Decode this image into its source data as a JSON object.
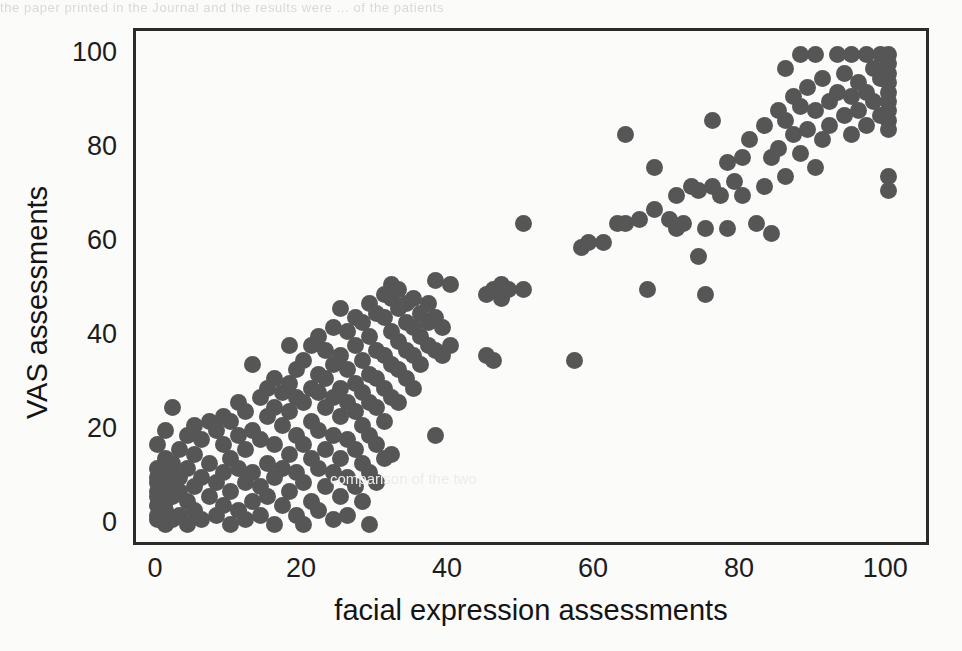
{
  "page": {
    "bleed_through_top": "the paper printed in the Journal  and the  results  were  ...  of the  patients",
    "bleed_through_middle": "comparison of the two"
  },
  "chart_data": {
    "type": "scatter",
    "title": "",
    "subtitle": "",
    "xlabel": "facial expression assessments",
    "ylabel": "VAS assessments",
    "xlim": [
      -3,
      106
    ],
    "ylim": [
      -5,
      105
    ],
    "xticks": [
      0,
      20,
      40,
      60,
      80,
      100
    ],
    "yticks": [
      0,
      20,
      40,
      60,
      80,
      100
    ],
    "xtick_labels": [
      "0",
      "20",
      "40",
      "60",
      "80",
      "100"
    ],
    "ytick_labels": [
      "0",
      "20",
      "40",
      "60",
      "80",
      "100"
    ],
    "grid": false,
    "legend": null,
    "marker": {
      "shape": "circle",
      "color": "#565656",
      "size_px": 17
    },
    "frame": {
      "color": "#2b2b2b",
      "width_px": 3,
      "all_sides": true
    },
    "series": [
      {
        "name": "patient assessment pairs",
        "color": "#565656",
        "points": [
          [
            0,
            1
          ],
          [
            0,
            2
          ],
          [
            0,
            4
          ],
          [
            0,
            6
          ],
          [
            0,
            7
          ],
          [
            0,
            9
          ],
          [
            0,
            10
          ],
          [
            0,
            12
          ],
          [
            0,
            17
          ],
          [
            1,
            0
          ],
          [
            1,
            3
          ],
          [
            1,
            5
          ],
          [
            1,
            8
          ],
          [
            1,
            11
          ],
          [
            1,
            14
          ],
          [
            1,
            20
          ],
          [
            2,
            1
          ],
          [
            2,
            6
          ],
          [
            2,
            9
          ],
          [
            2,
            13
          ],
          [
            2,
            25
          ],
          [
            3,
            2
          ],
          [
            3,
            7
          ],
          [
            3,
            10
          ],
          [
            3,
            16
          ],
          [
            4,
            0
          ],
          [
            4,
            5
          ],
          [
            4,
            12
          ],
          [
            4,
            19
          ],
          [
            5,
            3
          ],
          [
            5,
            8
          ],
          [
            5,
            15
          ],
          [
            5,
            21
          ],
          [
            6,
            1
          ],
          [
            6,
            10
          ],
          [
            6,
            18
          ],
          [
            7,
            6
          ],
          [
            7,
            13
          ],
          [
            7,
            22
          ],
          [
            8,
            2
          ],
          [
            8,
            9
          ],
          [
            8,
            20
          ],
          [
            9,
            4
          ],
          [
            9,
            11
          ],
          [
            9,
            17
          ],
          [
            9,
            23
          ],
          [
            10,
            0
          ],
          [
            10,
            7
          ],
          [
            10,
            14
          ],
          [
            10,
            22
          ],
          [
            11,
            3
          ],
          [
            11,
            12
          ],
          [
            11,
            19
          ],
          [
            11,
            26
          ],
          [
            12,
            1
          ],
          [
            12,
            9
          ],
          [
            12,
            16
          ],
          [
            12,
            24
          ],
          [
            13,
            5
          ],
          [
            13,
            11
          ],
          [
            13,
            20
          ],
          [
            13,
            34
          ],
          [
            14,
            2
          ],
          [
            14,
            8
          ],
          [
            14,
            18
          ],
          [
            14,
            27
          ],
          [
            15,
            6
          ],
          [
            15,
            13
          ],
          [
            15,
            23
          ],
          [
            15,
            29
          ],
          [
            16,
            0
          ],
          [
            16,
            10
          ],
          [
            16,
            17
          ],
          [
            16,
            25
          ],
          [
            16,
            31
          ],
          [
            17,
            4
          ],
          [
            17,
            12
          ],
          [
            17,
            21
          ],
          [
            17,
            28
          ],
          [
            18,
            7
          ],
          [
            18,
            15
          ],
          [
            18,
            24
          ],
          [
            18,
            30
          ],
          [
            18,
            38
          ],
          [
            19,
            2
          ],
          [
            19,
            11
          ],
          [
            19,
            19
          ],
          [
            19,
            27
          ],
          [
            19,
            33
          ],
          [
            20,
            0
          ],
          [
            20,
            9
          ],
          [
            20,
            17
          ],
          [
            20,
            26
          ],
          [
            20,
            35
          ],
          [
            21,
            5
          ],
          [
            21,
            14
          ],
          [
            21,
            22
          ],
          [
            21,
            29
          ],
          [
            21,
            38
          ],
          [
            22,
            3
          ],
          [
            22,
            12
          ],
          [
            22,
            20
          ],
          [
            22,
            28
          ],
          [
            22,
            32
          ],
          [
            22,
            40
          ],
          [
            23,
            8
          ],
          [
            23,
            16
          ],
          [
            23,
            25
          ],
          [
            23,
            31
          ],
          [
            23,
            37
          ],
          [
            24,
            1
          ],
          [
            24,
            11
          ],
          [
            24,
            19
          ],
          [
            24,
            27
          ],
          [
            24,
            34
          ],
          [
            24,
            42
          ],
          [
            25,
            6
          ],
          [
            25,
            14
          ],
          [
            25,
            23
          ],
          [
            25,
            29
          ],
          [
            25,
            36
          ],
          [
            25,
            46
          ],
          [
            26,
            2
          ],
          [
            26,
            10
          ],
          [
            26,
            18
          ],
          [
            26,
            26
          ],
          [
            26,
            33
          ],
          [
            26,
            41
          ],
          [
            27,
            8
          ],
          [
            27,
            16
          ],
          [
            27,
            24
          ],
          [
            27,
            30
          ],
          [
            27,
            38
          ],
          [
            27,
            44
          ],
          [
            28,
            5
          ],
          [
            28,
            13
          ],
          [
            28,
            21
          ],
          [
            28,
            28
          ],
          [
            28,
            35
          ],
          [
            28,
            43
          ],
          [
            29,
            0
          ],
          [
            29,
            11
          ],
          [
            29,
            19
          ],
          [
            29,
            26
          ],
          [
            29,
            32
          ],
          [
            29,
            40
          ],
          [
            29,
            47
          ],
          [
            30,
            9
          ],
          [
            30,
            17
          ],
          [
            30,
            25
          ],
          [
            30,
            31
          ],
          [
            30,
            37
          ],
          [
            30,
            45
          ],
          [
            31,
            14
          ],
          [
            31,
            22
          ],
          [
            31,
            29
          ],
          [
            31,
            36
          ],
          [
            31,
            44
          ],
          [
            31,
            49
          ],
          [
            32,
            15
          ],
          [
            32,
            27
          ],
          [
            32,
            34
          ],
          [
            32,
            41
          ],
          [
            32,
            48
          ],
          [
            32,
            51
          ],
          [
            33,
            26
          ],
          [
            33,
            33
          ],
          [
            33,
            39
          ],
          [
            33,
            46
          ],
          [
            33,
            50
          ],
          [
            34,
            31
          ],
          [
            34,
            37
          ],
          [
            34,
            43
          ],
          [
            34,
            47
          ],
          [
            35,
            29
          ],
          [
            35,
            36
          ],
          [
            35,
            42
          ],
          [
            35,
            48
          ],
          [
            36,
            34
          ],
          [
            36,
            40
          ],
          [
            36,
            45
          ],
          [
            37,
            38
          ],
          [
            37,
            43
          ],
          [
            37,
            47
          ],
          [
            38,
            19
          ],
          [
            38,
            37
          ],
          [
            38,
            44
          ],
          [
            38,
            52
          ],
          [
            39,
            36
          ],
          [
            39,
            42
          ],
          [
            40,
            38
          ],
          [
            40,
            51
          ],
          [
            45,
            36
          ],
          [
            45,
            49
          ],
          [
            46,
            35
          ],
          [
            46,
            50
          ],
          [
            47,
            48
          ],
          [
            47,
            51
          ],
          [
            48,
            50
          ],
          [
            50,
            64
          ],
          [
            50,
            50
          ],
          [
            57,
            35
          ],
          [
            58,
            59
          ],
          [
            59,
            60
          ],
          [
            61,
            60
          ],
          [
            63,
            64
          ],
          [
            64,
            83
          ],
          [
            64,
            64
          ],
          [
            66,
            65
          ],
          [
            67,
            50
          ],
          [
            68,
            67
          ],
          [
            68,
            76
          ],
          [
            70,
            65
          ],
          [
            71,
            70
          ],
          [
            71,
            63
          ],
          [
            72,
            64
          ],
          [
            73,
            72
          ],
          [
            74,
            71
          ],
          [
            74,
            57
          ],
          [
            75,
            49
          ],
          [
            75,
            63
          ],
          [
            76,
            86
          ],
          [
            76,
            72
          ],
          [
            77,
            70
          ],
          [
            78,
            77
          ],
          [
            78,
            63
          ],
          [
            79,
            73
          ],
          [
            80,
            78
          ],
          [
            80,
            70
          ],
          [
            81,
            82
          ],
          [
            82,
            64
          ],
          [
            83,
            72
          ],
          [
            83,
            85
          ],
          [
            84,
            62
          ],
          [
            84,
            78
          ],
          [
            85,
            88
          ],
          [
            85,
            80
          ],
          [
            86,
            97
          ],
          [
            86,
            86
          ],
          [
            86,
            74
          ],
          [
            87,
            91
          ],
          [
            87,
            83
          ],
          [
            88,
            100
          ],
          [
            88,
            89
          ],
          [
            88,
            79
          ],
          [
            89,
            93
          ],
          [
            89,
            84
          ],
          [
            90,
            100
          ],
          [
            90,
            88
          ],
          [
            90,
            76
          ],
          [
            91,
            82
          ],
          [
            91,
            95
          ],
          [
            92,
            90
          ],
          [
            92,
            85
          ],
          [
            93,
            100
          ],
          [
            93,
            92
          ],
          [
            94,
            87
          ],
          [
            94,
            96
          ],
          [
            95,
            100
          ],
          [
            95,
            91
          ],
          [
            95,
            83
          ],
          [
            96,
            94
          ],
          [
            96,
            88
          ],
          [
            97,
            100
          ],
          [
            97,
            92
          ],
          [
            97,
            85
          ],
          [
            98,
            97
          ],
          [
            98,
            90
          ],
          [
            99,
            100
          ],
          [
            99,
            95
          ],
          [
            99,
            87
          ],
          [
            100,
            100
          ],
          [
            100,
            98
          ],
          [
            100,
            96
          ],
          [
            100,
            94
          ],
          [
            100,
            92
          ],
          [
            100,
            90
          ],
          [
            100,
            88
          ],
          [
            100,
            86
          ],
          [
            100,
            84
          ],
          [
            100,
            74
          ],
          [
            100,
            71
          ]
        ]
      }
    ]
  }
}
